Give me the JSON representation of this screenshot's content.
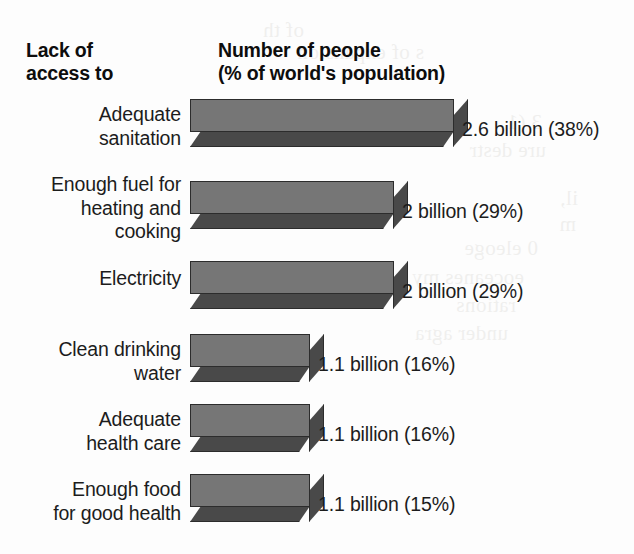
{
  "header": {
    "left_line1": "Lack of",
    "left_line2": "access to",
    "right_line1": "Number of people",
    "right_line2": "(% of world's population)"
  },
  "colors": {
    "bar_front": "#767676",
    "bar_shadow": "#494949",
    "bar_outline": "#2c2c2c",
    "background": "#fdfdfd",
    "text": "#1c1c1c"
  },
  "bleed_through": [
    {
      "text": "ure destr",
      "x": 88,
      "y": 138
    },
    {
      "text": "0  eleoge",
      "x": 96,
      "y": 236
    },
    {
      "text": "eoceanes my",
      "x": 110,
      "y": 265
    },
    {
      "text": "rations",
      "x": 118,
      "y": 293
    },
    {
      "text": "under agra",
      "x": 126,
      "y": 321
    },
    {
      "text": "of th",
      "x": 330,
      "y": 18
    },
    {
      "text": "s of expansion",
      "x": 210,
      "y": 40
    },
    {
      "text": "3 (1",
      "x": 92,
      "y": 110
    },
    {
      "text": "il,",
      "x": 56,
      "y": 186
    },
    {
      "text": "m",
      "x": 58,
      "y": 212
    }
  ],
  "chart_data": {
    "type": "bar",
    "title": "Lack of access to",
    "xlabel": "Number of people (% of world's population)",
    "ylabel": "Lack of access to",
    "orientation": "horizontal",
    "grid": false,
    "legend": "none",
    "xlim": [
      0,
      7
    ],
    "units": "billions of people",
    "categories": [
      "Adequate sanitation",
      "Enough fuel for heating and cooking",
      "Electricity",
      "Clean drinking water",
      "Adequate health care",
      "Enough food for good health"
    ],
    "values": [
      2.6,
      2,
      2,
      1.1,
      1.1,
      1.1
    ],
    "percents": [
      38,
      29,
      29,
      16,
      16,
      15
    ],
    "value_labels": [
      "2.6 billion (38%)",
      "2 billion (29%)",
      "2 billion (29%)",
      "1.1 billion (16%)",
      "1.1 billion (16%)",
      "1.1 billion (15%)"
    ]
  },
  "rows": [
    {
      "label_line1": "Adequate",
      "label_line2": "sanitation",
      "value_label": "2.6 billion (38%)",
      "value": 2.6,
      "percent": 38,
      "bar_width": 264,
      "row_top": 99,
      "label_top": 103,
      "value_left": 462,
      "value_top": 118
    },
    {
      "label_line1": "Enough fuel for",
      "label_line2": "heating and",
      "label_line3": "cooking",
      "value_label": "2 billion (29%)",
      "value": 2,
      "percent": 29,
      "bar_width": 204,
      "row_top": 181,
      "label_top": 173,
      "value_left": 402,
      "value_top": 200
    },
    {
      "label_line1": "Electricity",
      "value_label": "2 billion (29%)",
      "value": 2,
      "percent": 29,
      "bar_width": 204,
      "row_top": 261,
      "label_top": 267,
      "value_left": 402,
      "value_top": 280
    },
    {
      "label_line1": "Clean drinking",
      "label_line2": "water",
      "value_label": "1.1 billion (16%)",
      "value": 1.1,
      "percent": 16,
      "bar_width": 120,
      "row_top": 334,
      "label_top": 338,
      "value_left": 318,
      "value_top": 353
    },
    {
      "label_line1": "Adequate",
      "label_line2": "health care",
      "value_label": "1.1 billion (16%)",
      "value": 1.1,
      "percent": 16,
      "bar_width": 120,
      "row_top": 404,
      "label_top": 408,
      "value_left": 318,
      "value_top": 423
    },
    {
      "label_line1": "Enough food",
      "label_line2": "for good health",
      "value_label": "1.1 billion (15%)",
      "value": 1.1,
      "percent": 15,
      "bar_width": 120,
      "row_top": 474,
      "label_top": 478,
      "value_left": 318,
      "value_top": 493
    }
  ]
}
